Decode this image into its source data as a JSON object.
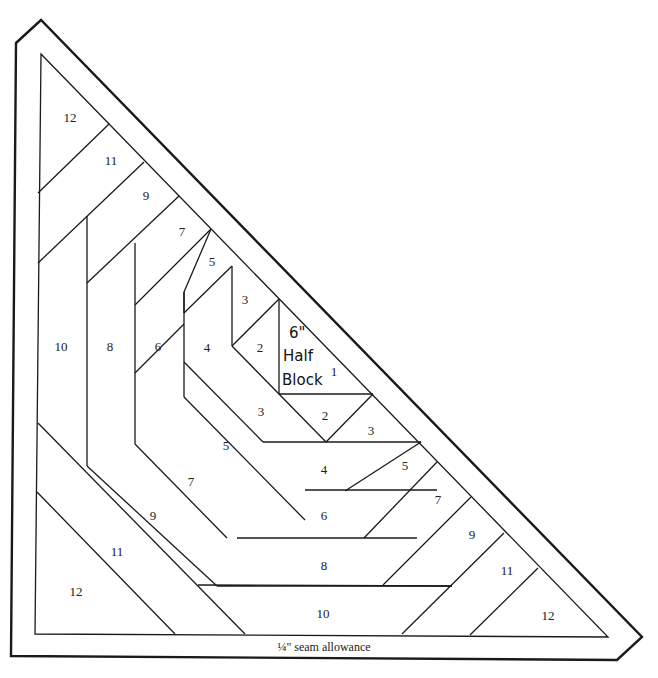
{
  "diagram": {
    "type": "quilt-foundation-pattern",
    "shape": "half-square-triangle",
    "center_label": {
      "line1": "6\"",
      "line2": "Half",
      "line3": "Block"
    },
    "seam_allowance_label": "¼\" seam allowance",
    "caption": "",
    "pieces": [
      {
        "id": "piece-1",
        "label": "1",
        "x": 334,
        "y": 372
      },
      {
        "id": "piece-2-upper",
        "label": "2",
        "x": 260,
        "y": 348
      },
      {
        "id": "piece-2-lower",
        "label": "2",
        "x": 325,
        "y": 416
      },
      {
        "id": "piece-3-upper",
        "label": "3",
        "x": 245,
        "y": 300
      },
      {
        "id": "piece-3-left",
        "label": "3",
        "x": 261,
        "y": 412
      },
      {
        "id": "piece-3-right",
        "label": "3",
        "x": 371,
        "y": 431
      },
      {
        "id": "piece-4-left",
        "label": "4",
        "x": 207,
        "y": 348
      },
      {
        "id": "piece-4-bottom",
        "label": "4",
        "x": 324,
        "y": 470
      },
      {
        "id": "piece-5-upper",
        "label": "5",
        "x": 212,
        "y": 262
      },
      {
        "id": "piece-5-left",
        "label": "5",
        "x": 226,
        "y": 446
      },
      {
        "id": "piece-5-right",
        "label": "5",
        "x": 405,
        "y": 466
      },
      {
        "id": "piece-6-left",
        "label": "6",
        "x": 158,
        "y": 347
      },
      {
        "id": "piece-6-bottom",
        "label": "6",
        "x": 324,
        "y": 516
      },
      {
        "id": "piece-7-upper",
        "label": "7",
        "x": 182,
        "y": 232
      },
      {
        "id": "piece-7-left",
        "label": "7",
        "x": 191,
        "y": 482
      },
      {
        "id": "piece-7-right",
        "label": "7",
        "x": 438,
        "y": 500
      },
      {
        "id": "piece-8-left",
        "label": "8",
        "x": 110,
        "y": 347
      },
      {
        "id": "piece-8-bottom",
        "label": "8",
        "x": 324,
        "y": 566
      },
      {
        "id": "piece-9-upper",
        "label": "9",
        "x": 146,
        "y": 196
      },
      {
        "id": "piece-9-left",
        "label": "9",
        "x": 153,
        "y": 516
      },
      {
        "id": "piece-9-right",
        "label": "9",
        "x": 472,
        "y": 535
      },
      {
        "id": "piece-10-left",
        "label": "10",
        "x": 61,
        "y": 347
      },
      {
        "id": "piece-10-bottom",
        "label": "10",
        "x": 323,
        "y": 614
      },
      {
        "id": "piece-11-upper",
        "label": "11",
        "x": 111,
        "y": 161
      },
      {
        "id": "piece-11-left",
        "label": "11",
        "x": 117,
        "y": 552
      },
      {
        "id": "piece-11-right",
        "label": "11",
        "x": 507,
        "y": 571
      },
      {
        "id": "piece-12-top",
        "label": "12",
        "x": 70,
        "y": 118
      },
      {
        "id": "piece-12-bottom-left",
        "label": "12",
        "x": 76,
        "y": 592
      },
      {
        "id": "piece-12-bottom-right",
        "label": "12",
        "x": 548,
        "y": 616
      }
    ]
  }
}
